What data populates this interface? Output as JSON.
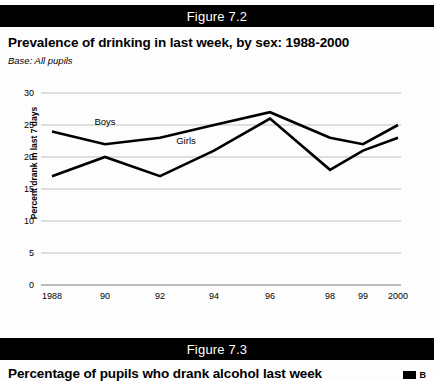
{
  "figure_72": {
    "bar_label": "Figure 7.2",
    "title": "Prevalence of drinking in last week, by sex: 1988-2000",
    "base": "Base: All pupils"
  },
  "figure_73": {
    "bar_label": "Figure 7.3",
    "title": "Percentage of pupils who drank alcohol last week",
    "legend_label": "B"
  },
  "colors": {
    "bar_background": "#000000",
    "bar_text": "#ffffff",
    "line": "#000000",
    "gridline": "#b8b8b8",
    "axis": "#7a7a7a",
    "page_background": "#fdfdfd"
  },
  "chart_data": {
    "type": "line",
    "title": "Prevalence of drinking in last week, by sex: 1988-2000",
    "subtitle": "Base: All pupils",
    "xlabel": "",
    "ylabel": "Percent drank in last 7 days",
    "categories": [
      "1988",
      "90",
      "92",
      "94",
      "96",
      "98",
      "99",
      "2000"
    ],
    "x_tick_labels": [
      "1988",
      "90",
      "92",
      "94",
      "96",
      "98",
      "99",
      "2000"
    ],
    "ylim": [
      0,
      30
    ],
    "y_ticks": [
      0,
      5,
      10,
      15,
      20,
      25,
      30
    ],
    "grid": true,
    "legend": "inline-labels",
    "series": [
      {
        "name": "Boys",
        "label_text": "Boys",
        "values": [
          24,
          22,
          23,
          25,
          27,
          23,
          22,
          25
        ]
      },
      {
        "name": "Girls",
        "label_text": "Girls",
        "values": [
          17,
          20,
          17,
          21,
          26,
          18,
          21,
          23
        ]
      }
    ]
  }
}
